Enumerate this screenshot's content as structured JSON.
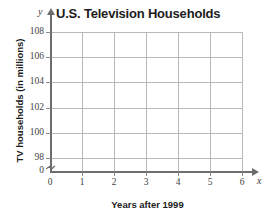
{
  "chart_data": {
    "type": "scatter",
    "title": "U.S. Television Households",
    "xlabel": "Years after 1999",
    "ylabel": "TV households (in millions)",
    "x_axis_variable": "x",
    "y_axis_variable": "y",
    "x_ticks": [
      "0",
      "1",
      "2",
      "3",
      "4",
      "5",
      "6"
    ],
    "x_tick_values": [
      0,
      1,
      2,
      3,
      4,
      5,
      6
    ],
    "y_ticks": [
      "0",
      "98",
      "100",
      "102",
      "104",
      "106",
      "108"
    ],
    "y_tick_values": [
      0,
      98,
      100,
      102,
      104,
      106,
      108
    ],
    "xlim": [
      0,
      6
    ],
    "ylim": [
      98,
      108
    ],
    "grid": true,
    "legend": "none",
    "series": [],
    "values": [],
    "annotations": [],
    "y_axis_break": true,
    "note": "Empty coordinate grid with no plotted data points",
    "colors": {
      "grid": "#b9b9b9",
      "axis": "#6d6d6d",
      "text": "#1c1c1c",
      "tick_text": "#3f3f3f",
      "background": "#ffffff"
    }
  }
}
